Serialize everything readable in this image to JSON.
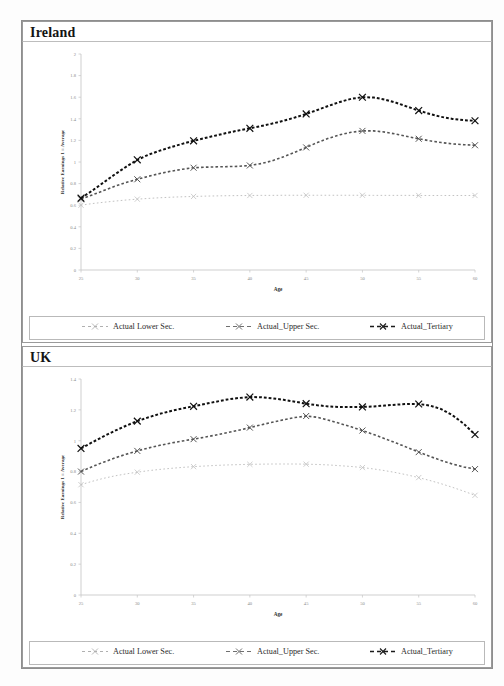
{
  "page": {
    "background_color": "#ffffff",
    "frame_color": "#8e8e8e"
  },
  "panels": [
    {
      "id": "ireland",
      "title": "Ireland",
      "legend": [
        {
          "label": "Actual Lower Sec.",
          "marker": "x",
          "color": "#b9b9b9",
          "dash": "2 3"
        },
        {
          "label": "Actual_Upper Sec.",
          "marker": "x",
          "color": "#6f6f6f",
          "dash": "3 2"
        },
        {
          "label": "Actual_Tertiary",
          "marker": "x",
          "color": "#1b1b1b",
          "dash": "3 2"
        }
      ]
    },
    {
      "id": "uk",
      "title": "UK",
      "legend": [
        {
          "label": "Actual Lower Sec.",
          "marker": "x",
          "color": "#b9b9b9",
          "dash": "2 3"
        },
        {
          "label": "Actual_Upper Sec.",
          "marker": "x",
          "color": "#6f6f6f",
          "dash": "3 2"
        },
        {
          "label": "Actual_Tertiary",
          "marker": "x",
          "color": "#1b1b1b",
          "dash": "3 2"
        }
      ]
    }
  ],
  "chart_data": [
    {
      "id": "ireland",
      "type": "line",
      "title": "Ireland",
      "xlabel": "Age",
      "ylabel": "Relative Earnings 1 = Average",
      "xlim": [
        25,
        60
      ],
      "ylim": [
        0,
        2
      ],
      "xticks": [
        25,
        30,
        35,
        40,
        45,
        50,
        55,
        60
      ],
      "yticks": [
        0,
        0.2,
        0.4,
        0.6,
        0.8,
        1,
        1.2,
        1.4,
        1.6,
        1.8,
        2
      ],
      "grid": false,
      "legend_position": "bottom",
      "x": [
        25,
        26,
        27,
        28,
        29,
        30,
        31,
        32,
        33,
        34,
        35,
        36,
        37,
        38,
        39,
        40,
        41,
        42,
        43,
        44,
        45,
        46,
        47,
        48,
        49,
        50,
        51,
        52,
        53,
        54,
        55,
        56,
        57,
        58,
        59,
        60
      ],
      "series": [
        {
          "name": "Actual Lower Sec.",
          "marker_ages": [
            25,
            30,
            35,
            40,
            45,
            50,
            55,
            60
          ],
          "values": [
            0.6,
            0.615,
            0.627,
            0.638,
            0.648,
            0.656,
            0.663,
            0.669,
            0.674,
            0.678,
            0.681,
            0.684,
            0.686,
            0.688,
            0.689,
            0.69,
            0.691,
            0.691,
            0.692,
            0.692,
            0.692,
            0.692,
            0.692,
            0.692,
            0.692,
            0.692,
            0.691,
            0.691,
            0.691,
            0.691,
            0.69,
            0.69,
            0.69,
            0.69,
            0.69,
            0.69
          ]
        },
        {
          "name": "Actual_Upper Sec.",
          "marker_ages": [
            25,
            30,
            35,
            40,
            45,
            50,
            55,
            60
          ],
          "values": [
            0.655,
            0.695,
            0.735,
            0.775,
            0.81,
            0.84,
            0.868,
            0.893,
            0.915,
            0.933,
            0.947,
            0.952,
            0.955,
            0.957,
            0.96,
            0.968,
            0.985,
            1.012,
            1.048,
            1.09,
            1.135,
            1.18,
            1.22,
            1.252,
            1.275,
            1.288,
            1.288,
            1.277,
            1.258,
            1.236,
            1.215,
            1.196,
            1.18,
            1.168,
            1.16,
            1.155
          ]
        },
        {
          "name": "Actual_Tertiary",
          "marker_ages": [
            25,
            30,
            35,
            40,
            45,
            50,
            55,
            60
          ],
          "values": [
            0.665,
            0.735,
            0.81,
            0.885,
            0.955,
            1.02,
            1.068,
            1.105,
            1.138,
            1.168,
            1.196,
            1.222,
            1.246,
            1.27,
            1.292,
            1.312,
            1.333,
            1.356,
            1.382,
            1.412,
            1.445,
            1.482,
            1.52,
            1.556,
            1.585,
            1.6,
            1.597,
            1.578,
            1.548,
            1.512,
            1.476,
            1.444,
            1.418,
            1.399,
            1.387,
            1.382
          ]
        }
      ]
    },
    {
      "id": "uk",
      "type": "line",
      "title": "UK",
      "xlabel": "Age",
      "ylabel": "Relative Earnings 1 = Average",
      "xlim": [
        25,
        60
      ],
      "ylim": [
        0,
        1.4
      ],
      "xticks": [
        25,
        30,
        35,
        40,
        45,
        50,
        55,
        60
      ],
      "yticks": [
        0,
        0.2,
        0.4,
        0.6,
        0.8,
        1,
        1.2,
        1.4
      ],
      "grid": false,
      "legend_position": "bottom",
      "x": [
        25,
        26,
        27,
        28,
        29,
        30,
        31,
        32,
        33,
        34,
        35,
        36,
        37,
        38,
        39,
        40,
        41,
        42,
        43,
        44,
        45,
        46,
        47,
        48,
        49,
        50,
        51,
        52,
        53,
        54,
        55,
        56,
        57,
        58,
        59,
        60
      ],
      "series": [
        {
          "name": "Actual Lower Sec.",
          "marker_ages": [
            25,
            30,
            35,
            40,
            45,
            50,
            55,
            60
          ],
          "values": [
            0.715,
            0.737,
            0.756,
            0.772,
            0.785,
            0.796,
            0.806,
            0.814,
            0.821,
            0.827,
            0.832,
            0.836,
            0.84,
            0.843,
            0.845,
            0.847,
            0.848,
            0.849,
            0.849,
            0.849,
            0.848,
            0.846,
            0.843,
            0.838,
            0.833,
            0.826,
            0.817,
            0.806,
            0.793,
            0.778,
            0.761,
            0.742,
            0.721,
            0.698,
            0.673,
            0.646
          ]
        },
        {
          "name": "Actual_Upper Sec.",
          "marker_ages": [
            25,
            30,
            35,
            40,
            45,
            50,
            55,
            60
          ],
          "values": [
            0.8,
            0.832,
            0.861,
            0.888,
            0.912,
            0.934,
            0.953,
            0.97,
            0.985,
            0.998,
            1.01,
            1.023,
            1.037,
            1.052,
            1.068,
            1.085,
            1.103,
            1.12,
            1.136,
            1.15,
            1.16,
            1.152,
            1.133,
            1.112,
            1.09,
            1.066,
            1.04,
            1.013,
            0.985,
            0.956,
            0.926,
            0.898,
            0.872,
            0.849,
            0.83,
            0.816
          ]
        },
        {
          "name": "Actual_Tertiary",
          "marker_ages": [
            25,
            30,
            35,
            40,
            45,
            50,
            55,
            60
          ],
          "values": [
            0.95,
            0.99,
            1.028,
            1.064,
            1.097,
            1.127,
            1.152,
            1.174,
            1.193,
            1.209,
            1.223,
            1.238,
            1.253,
            1.267,
            1.277,
            1.283,
            1.282,
            1.275,
            1.265,
            1.253,
            1.24,
            1.23,
            1.222,
            1.218,
            1.218,
            1.219,
            1.222,
            1.228,
            1.234,
            1.238,
            1.238,
            1.228,
            1.205,
            1.165,
            1.11,
            1.04
          ]
        }
      ]
    }
  ]
}
